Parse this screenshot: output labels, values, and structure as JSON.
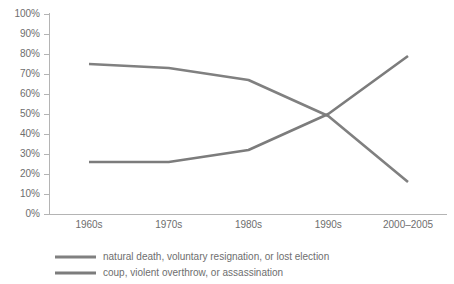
{
  "chart_data": {
    "type": "line",
    "title": "",
    "subtitle": "",
    "xlabel": "",
    "ylabel": "",
    "categories": [
      "1960s",
      "1970s",
      "1980s",
      "1990s",
      "2000–2005"
    ],
    "ylim": [
      0,
      100
    ],
    "yticks": [
      0,
      10,
      20,
      30,
      40,
      50,
      60,
      70,
      80,
      90,
      100
    ],
    "ytick_labels": [
      "0%",
      "10%",
      "20%",
      "30%",
      "40%",
      "50%",
      "60%",
      "70%",
      "80%",
      "90%",
      "100%"
    ],
    "grid": false,
    "legend_position": "bottom-left",
    "series": [
      {
        "name": "natural death, voluntary resignation, or lost election",
        "values": [
          75,
          73,
          67,
          49,
          16
        ],
        "color": "#808080"
      },
      {
        "name": "coup, violent overthrow, or assassination",
        "values": [
          26,
          26,
          32,
          50,
          79
        ],
        "color": "#7c7c7c"
      }
    ],
    "annotations": []
  },
  "axis": {
    "y_axis_name": "percentage-axis",
    "x_axis_name": "decade-axis"
  },
  "legend": {
    "items": [
      {
        "label": "natural death, voluntary resignation, or lost election"
      },
      {
        "label": "coup, violent overthrow, or assassination"
      }
    ]
  },
  "colors": {
    "axis": "#b4b4b4",
    "text": "#6e6e6e",
    "series_1": "#808080",
    "series_2": "#7c7c7c",
    "background": "#ffffff"
  }
}
